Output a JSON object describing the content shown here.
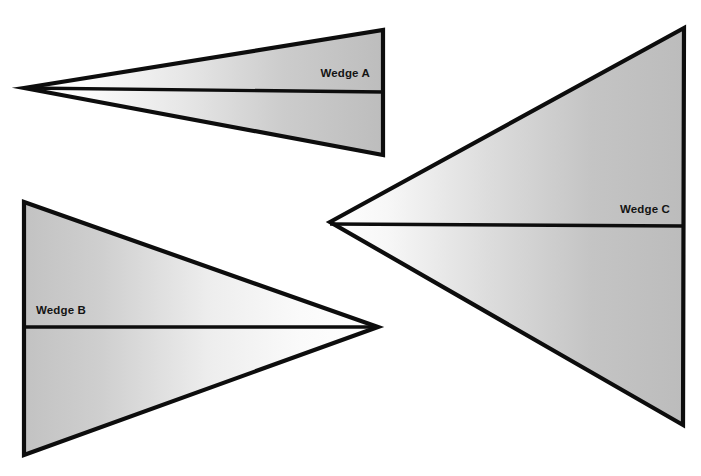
{
  "figure": {
    "title": "",
    "background_color": "#ffffff",
    "stroke_color": "#0d0d0d",
    "fill_light": "#ffffff",
    "fill_gray": "#b3b3b3",
    "label_color": "#141414",
    "canvas": {
      "width": 701,
      "height": 476
    }
  },
  "wedges": [
    {
      "id": "wedge-a",
      "label": "Wedge A",
      "opens": "right",
      "apex": {
        "x": 24,
        "y": 88
      },
      "top_vertex": {
        "x": 383,
        "y": 30
      },
      "bottom_vertex": {
        "x": 383,
        "y": 155
      },
      "bisector": {
        "x1": 24,
        "y1": 88,
        "x2": 383,
        "y2": 92
      },
      "label_position": {
        "x": 370,
        "y": 77
      },
      "label_anchor": "end",
      "points": "24,88 383,30 383,155",
      "relative_size": "smallest"
    },
    {
      "id": "wedge-b",
      "label": "Wedge B",
      "opens": "left",
      "apex": {
        "x": 378,
        "y": 327
      },
      "top_vertex": {
        "x": 24,
        "y": 202
      },
      "bottom_vertex": {
        "x": 24,
        "y": 455
      },
      "bisector": {
        "x1": 24,
        "y1": 327,
        "x2": 378,
        "y2": 327
      },
      "label_position": {
        "x": 36,
        "y": 314
      },
      "label_anchor": "start",
      "points": "378,327 24,202 24,455",
      "relative_size": "medium"
    },
    {
      "id": "wedge-c",
      "label": "Wedge C",
      "opens": "right",
      "apex": {
        "x": 330,
        "y": 222
      },
      "top_vertex": {
        "x": 684,
        "y": 28
      },
      "bottom_vertex": {
        "x": 683,
        "y": 425
      },
      "bisector": {
        "x1": 330,
        "y1": 224,
        "x2": 683,
        "y2": 226
      },
      "label_position": {
        "x": 670,
        "y": 213
      },
      "label_anchor": "end",
      "points": "330,222 684,28 683,425",
      "relative_size": "largest"
    }
  ]
}
